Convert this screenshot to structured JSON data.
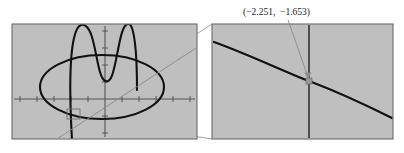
{
  "figure": {
    "background_color": "#ffffff",
    "panel_fill": "#bfbfbf",
    "panel_border_color": "#6b6b6b",
    "curve_color": "#111111",
    "axis_color": "#555555",
    "connector_color": "#8a8a8a",
    "annotation_color": "#1a1a1a"
  },
  "annotation": {
    "point_label": "(−2.251,  −1.653)",
    "x_value": "−2.251",
    "y_value": "−1.653"
  },
  "left_panel": {
    "name": "original-graph-view",
    "rect": {
      "x": 12,
      "y": 24,
      "width": 185,
      "height": 115
    },
    "axes": {
      "x_axis_y": 99,
      "y_axis_x": 105,
      "x_tick_spacing": 17,
      "y_tick_spacing": 17,
      "x_tick_count": 11,
      "y_tick_count": 7
    },
    "curves": [
      {
        "name": "ellipse",
        "type": "ellipse",
        "cx": 102,
        "cy": 87,
        "rx": 62,
        "ry": 32
      },
      {
        "name": "quartic-w-curve",
        "type": "quartic"
      },
      {
        "name": "straight-line",
        "type": "line"
      }
    ],
    "zoom_box": {
      "x": 67,
      "y": 109,
      "width": 13,
      "height": 10
    }
  },
  "right_panel": {
    "name": "magnified-view",
    "rect": {
      "x": 212,
      "y": 24,
      "width": 181,
      "height": 115
    },
    "axes": {
      "vertical_line_x": 309
    },
    "curves": [
      {
        "name": "magnified-curve",
        "type": "line"
      }
    ],
    "marked_point": {
      "x": 309,
      "y": 81
    }
  },
  "connectors": [
    {
      "name": "connector-upper",
      "from_x": 80,
      "from_y": 109,
      "to_x": 212,
      "to_y": 24
    },
    {
      "name": "connector-lower",
      "from_x": 80,
      "from_y": 119,
      "to_x": 212,
      "to_y": 139
    }
  ],
  "annotation_leader": {
    "name": "annotation-arrow",
    "from_x": 288,
    "from_y": 20,
    "to_x": 309,
    "to_y": 79
  }
}
